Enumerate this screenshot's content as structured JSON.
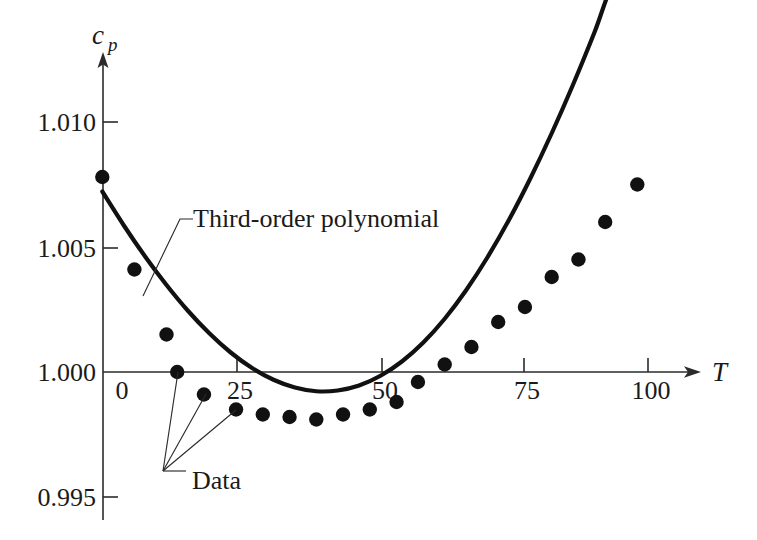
{
  "chart_data": {
    "type": "scatter",
    "title": "",
    "subtitle": "",
    "xlabel": "T",
    "ylabel": "c",
    "ylabel_sub": "p",
    "xlim": [
      -10,
      110
    ],
    "ylim": [
      0.995,
      1.0115
    ],
    "grid": false,
    "legend_position": "none",
    "xticks": [
      0,
      25,
      50,
      75,
      100
    ],
    "xtick_labels": [
      "0",
      "25",
      "50",
      "75",
      "100"
    ],
    "yticks": [
      0.995,
      1.0,
      1.005,
      1.01
    ],
    "ytick_labels": [
      "0.995",
      "1.000",
      "1.005",
      "1.010"
    ],
    "series": [
      {
        "name": "Data",
        "type": "scatter",
        "marker": "filled-circle",
        "color": "#111111",
        "x": [
          -2,
          4,
          10,
          12,
          17,
          23,
          28,
          33,
          38,
          43,
          48,
          53,
          57,
          62,
          67,
          72,
          77,
          82,
          87,
          92,
          98
        ],
        "y": [
          1.0078,
          1.0041,
          1.0015,
          1.0,
          0.9991,
          0.9985,
          0.9983,
          0.9982,
          0.9981,
          0.9983,
          0.9985,
          0.9988,
          0.9996,
          1.0003,
          1.001,
          1.002,
          1.0026,
          1.0038,
          1.0045,
          1.006,
          1.0075
        ]
      },
      {
        "name": "Third-order polynomial",
        "type": "line",
        "color": "#111111",
        "x": [
          -2,
          2,
          6,
          10,
          14,
          18,
          22,
          26,
          30,
          34,
          38,
          42,
          46,
          50,
          54,
          58,
          62,
          66,
          70,
          74,
          78,
          82,
          86,
          90,
          94,
          99
        ],
        "y": [
          1.00722,
          1.00587,
          1.00462,
          1.00348,
          1.00245,
          1.00155,
          1.00078,
          1.00016,
          0.99969,
          0.99938,
          0.99923,
          0.99926,
          0.99946,
          0.99985,
          1.00042,
          1.00118,
          1.00213,
          1.00327,
          1.00459,
          1.00608,
          1.00774,
          1.00955,
          1.0115,
          1.01359,
          1.0158,
          1.0168
        ]
      }
    ],
    "annotations": [
      {
        "id": "poly-annotation",
        "text": "Third-order polynomial",
        "text_x": 193,
        "text_y": 227,
        "leader": "M 143 296 L 180 219 L 193 219"
      },
      {
        "id": "data-annotation",
        "text": "Data",
        "text_x": 192,
        "text_y": 489,
        "leader_hub_x": 163,
        "leader_hub_y": 471,
        "leader_targets": [
          [
            178,
            372
          ],
          [
            206,
            394
          ],
          [
            236,
            410
          ]
        ],
        "leader_tail": "M 163 471 L 186 471"
      }
    ]
  },
  "axes": {
    "y_axis_top_label": "c",
    "y_axis_top_label_sub": "p",
    "x_axis_right_label": "T",
    "y_ticks": [
      {
        "label": "1.010",
        "px": 122
      },
      {
        "label": "1.005",
        "px": 248
      },
      {
        "label": "1.000",
        "px": 372
      },
      {
        "label": "0.995",
        "px": 497
      }
    ],
    "x_ticks": [
      {
        "label": "0",
        "px": 113
      },
      {
        "label": "25",
        "px": 237
      },
      {
        "label": "50",
        "px": 382
      },
      {
        "label": "75",
        "px": 524
      },
      {
        "label": "100",
        "px": 648
      }
    ]
  },
  "colors": {
    "ink": "#111111",
    "axis": "#2b2b2b",
    "background": "#ffffff"
  }
}
